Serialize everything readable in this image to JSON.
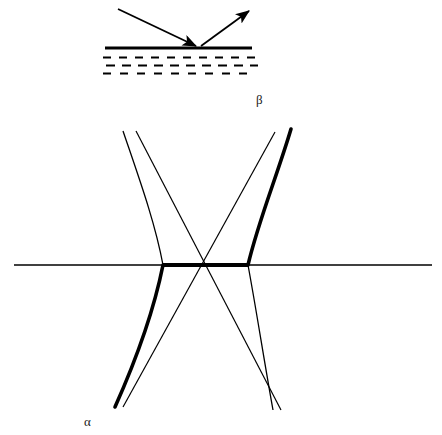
{
  "figure": {
    "background_color": "#ffffff",
    "ink_color": "#000000",
    "width": 442,
    "height": 435
  },
  "panels": [
    {
      "id": "panel-beta",
      "label": "β",
      "label_position": {
        "x": 256,
        "y": 93
      },
      "description": "Incident ray reflecting off a horizontal surface above a hatched (dashed) medium"
    },
    {
      "id": "panel-alpha",
      "label": "α",
      "label_position": {
        "x": 84,
        "y": 415
      },
      "description": "Hyperbola branches with crossing asymptotes and a horizontal axis"
    }
  ],
  "reflection_diagram": {
    "surface_line": {
      "x1": 105,
      "y1": 48,
      "x2": 252,
      "y2": 48,
      "stroke_width": 2.6
    },
    "incident_ray": {
      "x1": 118,
      "y1": 9,
      "x2": 198,
      "y2": 47,
      "arrow": "end"
    },
    "reflected_ray": {
      "x1": 200,
      "y1": 47,
      "x2": 250,
      "y2": 10,
      "arrow": "end"
    },
    "hatch_rows": [
      {
        "y": 57,
        "x_start": 103,
        "x_end": 258,
        "dash": "7 7"
      },
      {
        "y": 65,
        "x_start": 103,
        "x_end": 258,
        "dash": "8 6"
      },
      {
        "y": 73,
        "x_start": 103,
        "x_end": 258,
        "dash": "7 8"
      }
    ]
  },
  "hyperbola_diagram": {
    "axis": {
      "x1": 14,
      "y1": 265,
      "x2": 432,
      "y2": 265,
      "stroke_width": 1.2
    },
    "center": {
      "x": 205,
      "y": 265
    },
    "vertex_left": {
      "x": 163,
      "y": 265
    },
    "vertex_right": {
      "x": 248,
      "y": 265
    },
    "thick_stroke_width": 3.4,
    "thin_stroke_width": 1.2,
    "highlighted_path_description": "upper-right branch, right vertex, horizontal chord to left vertex, lower-left branch",
    "asymptotes": [
      {
        "x1": 136,
        "y1": 131,
        "x2": 281,
        "y2": 410
      },
      {
        "x1": 275,
        "y1": 132,
        "x2": 123,
        "y2": 407
      }
    ],
    "branch_endpoints": {
      "upper_left_thin": {
        "x": 123,
        "y": 131
      },
      "upper_right_thick": {
        "x": 291,
        "y": 129
      },
      "lower_left_thick": {
        "x": 115,
        "y": 407
      },
      "lower_right_thin": {
        "x": 273,
        "y": 410
      }
    }
  }
}
